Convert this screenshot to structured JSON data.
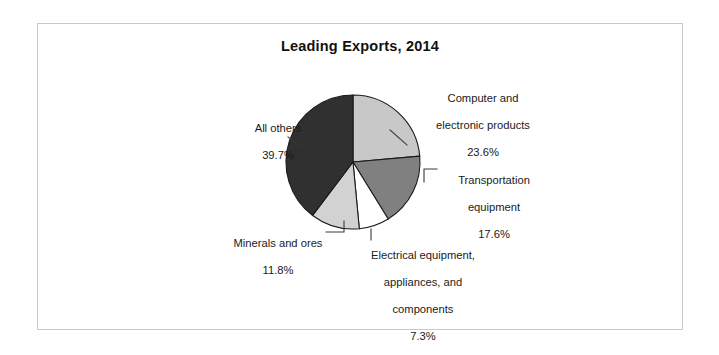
{
  "chart_data": {
    "type": "pie",
    "title": "Leading Exports, 2014",
    "categories": [
      "Computer and electronic products",
      "Transportation equipment",
      "Electrical equipment, appliances, and components",
      "Minerals and ores",
      "All others"
    ],
    "values": [
      23.6,
      17.6,
      7.3,
      11.8,
      39.7
    ],
    "value_labels": [
      "23.6%",
      "17.6%",
      "7.3%",
      "11.8%",
      "39.7%"
    ],
    "units": "percent",
    "legend": "none",
    "grid": false,
    "start_angle_deg": 0,
    "direction": "clockwise",
    "slice_colors": [
      "#c8c8c8",
      "#808080",
      "#ffffff",
      "#d2d2d2",
      "#303030"
    ],
    "border_color": "#1a1a1a",
    "xlabel": "",
    "ylabel": "",
    "slices": [
      {
        "name": "Computer and electronic products",
        "label_line_1": "Computer and",
        "label_line_2": "electronic products",
        "percent": "23.6%",
        "value": 23.6,
        "color": "#c8c8c8"
      },
      {
        "name": "Transportation equipment",
        "label_line_1": "Transportation",
        "label_line_2": "equipment",
        "percent": "17.6%",
        "value": 17.6,
        "color": "#808080"
      },
      {
        "name": "Electrical equipment, appliances, and components",
        "label_line_1": "Electrical equipment,",
        "label_line_2": "appliances, and",
        "label_line_3": "components",
        "percent": "7.3%",
        "value": 7.3,
        "color": "#ffffff"
      },
      {
        "name": "Minerals and ores",
        "label_line_1": "Minerals and ores",
        "percent": "11.8%",
        "value": 11.8,
        "color": "#d2d2d2"
      },
      {
        "name": "All others",
        "label_line_1": "All others",
        "percent": "39.7%",
        "value": 39.7,
        "color": "#303030"
      }
    ]
  }
}
